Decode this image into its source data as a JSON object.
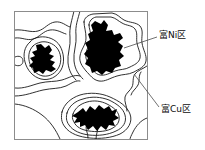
{
  "figure": {
    "type": "microstructure-schematic",
    "frame": {
      "stroke_color": "#8c8c8c",
      "background_color": "#ffffff",
      "x": 14,
      "y": 11,
      "width": 134,
      "height": 129
    },
    "phases": {
      "dark_region_color": "#000000",
      "contour_stroke_color": "#1a1a1a",
      "matrix_color": "#ffffff"
    },
    "annotations": [
      {
        "id": "ni",
        "text": "富Ni区",
        "meaning": "Ni-rich region",
        "leader_from": {
          "x": 157,
          "y": 37
        },
        "leader_to": {
          "x": 124,
          "y": 48
        }
      },
      {
        "id": "cu",
        "text": "富Cu区",
        "meaning": "Cu-rich region",
        "leader_from": {
          "x": 159,
          "y": 107
        },
        "leader_to": {
          "x": 134,
          "y": 74
        }
      }
    ],
    "dark_blobs": [
      {
        "id": "left-blob",
        "cx": 45,
        "cy": 60
      },
      {
        "id": "upper-right-blob",
        "cx": 100,
        "cy": 48
      },
      {
        "id": "bottom-blob",
        "cx": 92,
        "cy": 113
      }
    ]
  }
}
